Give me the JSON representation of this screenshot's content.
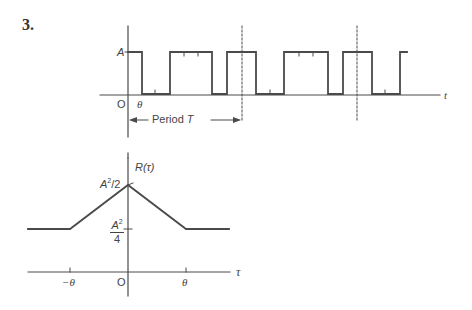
{
  "problem_number": "3.",
  "top_plot": {
    "y_level_label": "A",
    "origin_label": "O",
    "theta_label": "θ",
    "x_axis_label": "t",
    "period_label": "Period T",
    "period_label_text": "Period ",
    "period_symbol": "T",
    "pulse_edges_x": [
      128,
      142,
      170,
      212,
      227,
      256,
      284,
      328,
      343,
      372,
      400,
      407
    ],
    "dashed_markers_x": [
      242,
      357
    ]
  },
  "bottom_plot": {
    "y_axis_label": "R(τ)",
    "peak_label": "A²/2",
    "peak_label_base": "A",
    "peak_label_exp": "2",
    "peak_label_rest": "/2",
    "floor_label_num_base": "A",
    "floor_label_num_exp": "2",
    "floor_label_den": "4",
    "origin_label": "O",
    "x_axis_label": "τ",
    "tick_neg": "−θ",
    "tick_pos": "θ"
  }
}
